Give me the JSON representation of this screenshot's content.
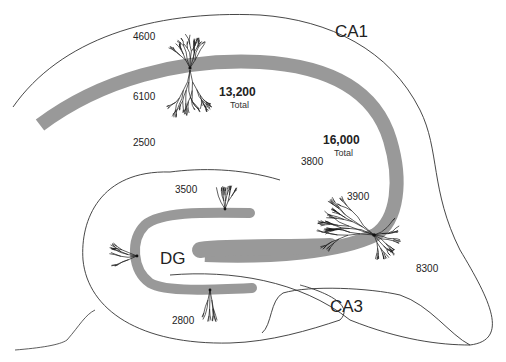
{
  "figure": {
    "regions": {
      "ca1": "CA1",
      "ca3": "CA3",
      "dg": "DG"
    },
    "ca1_cell": {
      "apical_tuft_count": "4600",
      "apical_oblique_count": "6100",
      "basal_count": "2500",
      "total_value": "13,200",
      "total_label": "Total"
    },
    "ca3_cell": {
      "apical_distal_count": "3800",
      "apical_proximal_count": "3900",
      "basal_count": "8300",
      "total_value": "16,000",
      "total_label": "Total"
    },
    "dg_cells": {
      "upper_granule_count": "3500",
      "lower_granule_count": "2800"
    },
    "colors": {
      "cell_layer": "#999999",
      "outline": "#333333",
      "dendrite": "#1a1a1a"
    }
  }
}
